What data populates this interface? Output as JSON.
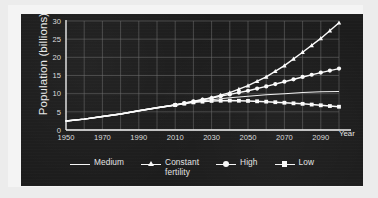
{
  "chart_data": {
    "type": "line",
    "title": "",
    "subtitle": "",
    "xlabel": "Year",
    "ylabel": "Population (billions)",
    "xlim": [
      1950,
      2100
    ],
    "ylim": [
      0,
      30
    ],
    "xticks": [
      1950,
      1970,
      1990,
      2010,
      2030,
      2050,
      2070,
      2090
    ],
    "yticks": [
      0,
      5,
      10,
      15,
      20,
      25,
      30
    ],
    "xtick_labels": [
      "1950",
      "1970",
      "1990",
      "2010",
      "2030",
      "2050",
      "2070",
      "2090"
    ],
    "ytick_labels": [
      "0",
      "5",
      "10",
      "15",
      "20",
      "25",
      "30"
    ],
    "x_minor_step": 10,
    "y_minor_step": 5,
    "grid": true,
    "grid_color": "#6e6e6e",
    "legend_position": "bottom",
    "background_color": "#1c1c1c",
    "line_color": "#fbfbfb",
    "x": [
      1950,
      1960,
      1970,
      1980,
      1990,
      2000,
      2010,
      2020,
      2030,
      2040,
      2050,
      2060,
      2070,
      2080,
      2090,
      2100
    ],
    "series": [
      {
        "name": "Medium",
        "marker": "none",
        "values": [
          2.5,
          3.0,
          3.7,
          4.4,
          5.3,
          6.1,
          6.9,
          7.7,
          8.3,
          8.9,
          9.3,
          9.7,
          10.0,
          10.3,
          10.5,
          10.6
        ]
      },
      {
        "name": "Constant fertility",
        "marker": "triangle",
        "values": [
          2.5,
          3.0,
          3.7,
          4.4,
          5.3,
          6.1,
          6.9,
          7.8,
          8.9,
          10.3,
          12.2,
          14.6,
          17.7,
          21.4,
          25.2,
          29.5
        ]
      },
      {
        "name": "High",
        "marker": "circle",
        "values": [
          2.5,
          3.0,
          3.7,
          4.4,
          5.3,
          6.1,
          6.9,
          7.9,
          8.8,
          9.8,
          10.8,
          12.0,
          13.3,
          14.6,
          15.8,
          16.9
        ]
      },
      {
        "name": "Low",
        "marker": "square",
        "values": [
          2.5,
          3.0,
          3.7,
          4.4,
          5.3,
          6.1,
          6.9,
          7.6,
          8.0,
          8.1,
          8.0,
          7.8,
          7.5,
          7.2,
          6.8,
          6.4
        ]
      }
    ],
    "legend_entries": [
      {
        "label": "Medium",
        "marker": "none"
      },
      {
        "label": "Constant\nfertility",
        "marker": "triangle"
      },
      {
        "label": "High",
        "marker": "circle"
      },
      {
        "label": "Low",
        "marker": "square"
      }
    ],
    "marker_start_year": 2010,
    "annotations": []
  }
}
